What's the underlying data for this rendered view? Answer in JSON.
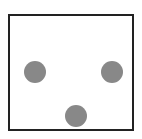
{
  "figure": {
    "frame": {
      "border_color": "#222222",
      "background": "#ffffff"
    },
    "dots": [
      {
        "name": "left",
        "cx": 35,
        "cy": 72,
        "r": 11,
        "color": "#888888"
      },
      {
        "name": "right",
        "cx": 112,
        "cy": 72,
        "r": 11,
        "color": "#888888"
      },
      {
        "name": "bottom",
        "cx": 76,
        "cy": 116,
        "r": 11,
        "color": "#888888"
      }
    ]
  }
}
